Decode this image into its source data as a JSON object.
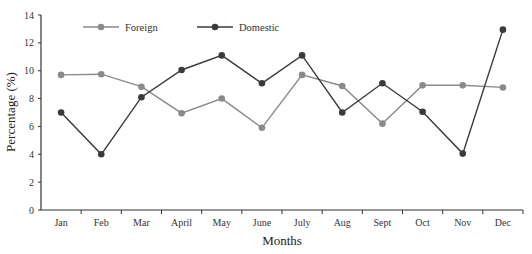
{
  "chart_data": {
    "type": "line",
    "title": "",
    "xlabel": "Months",
    "ylabel": "Percentage (%)",
    "ylim": [
      0,
      14
    ],
    "yticks": [
      0,
      2,
      4,
      6,
      8,
      10,
      12,
      14
    ],
    "grid": false,
    "legend_position": "top-left inside",
    "categories": [
      "Jan",
      "Feb",
      "Mar",
      "April",
      "May",
      "June",
      "July",
      "Aug",
      "Sept",
      "Oct",
      "Nov",
      "Dec"
    ],
    "series": [
      {
        "name": "Foreign",
        "color": "#8a8a8a",
        "values": [
          9.7,
          9.75,
          8.85,
          6.95,
          8.0,
          5.9,
          9.7,
          8.9,
          6.2,
          8.95,
          8.95,
          8.8
        ]
      },
      {
        "name": "Domestic",
        "color": "#3a3a3a",
        "values": [
          7.0,
          4.0,
          8.1,
          10.05,
          11.1,
          9.1,
          11.1,
          7.0,
          9.1,
          7.05,
          4.05,
          12.95
        ]
      }
    ]
  }
}
